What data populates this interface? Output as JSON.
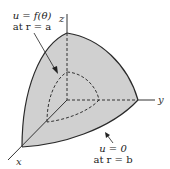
{
  "figure": {
    "type": "spherical-octant-region",
    "colors": {
      "background": "#ffffff",
      "region_fill": "#d0d0d0",
      "outline": "#2a2a2a",
      "axis": "#333333",
      "dashed": "#333333"
    },
    "axes": {
      "x_label": "x",
      "y_label": "y",
      "z_label": "z"
    },
    "annotations": {
      "inner": {
        "line1": "u = f(θ)",
        "line2": "at r = a"
      },
      "outer": {
        "line1": "u = 0",
        "line2": "at r = b"
      }
    }
  }
}
